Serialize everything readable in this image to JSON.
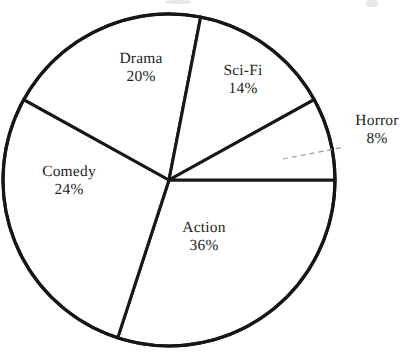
{
  "chart_data": {
    "type": "pie",
    "title": "",
    "xlabel": "",
    "ylabel": "",
    "categories": [
      "Action",
      "Comedy",
      "Drama",
      "Sci-Fi",
      "Horror"
    ],
    "values": [
      36,
      24,
      20,
      14,
      8
    ],
    "value_suffix": "%",
    "legend_position": "none",
    "grid": false,
    "slices": [
      {
        "name": "Action",
        "value": 36,
        "value_label": "36%",
        "start_angle_deg": 252,
        "end_angle_deg": 360,
        "label_x": 204,
        "label_y": 237,
        "label_placement": "inside",
        "fill": "#ffffff",
        "stroke": "#181818"
      },
      {
        "name": "Comedy",
        "value": 24,
        "value_label": "24%",
        "start_angle_deg": 151,
        "end_angle_deg": 252,
        "label_x": 69,
        "label_y": 181,
        "label_placement": "inside",
        "fill": "#ffffff",
        "stroke": "#181818"
      },
      {
        "name": "Drama",
        "value": 20,
        "value_label": "20%",
        "start_angle_deg": 79,
        "end_angle_deg": 151,
        "label_x": 141,
        "label_y": 68,
        "label_placement": "inside",
        "fill": "#ffffff",
        "stroke": "#181818"
      },
      {
        "name": "Sci-Fi",
        "value": 14,
        "value_label": "14%",
        "start_angle_deg": 29,
        "end_angle_deg": 79,
        "label_x": 243,
        "label_y": 80,
        "label_placement": "inside",
        "fill": "#ffffff",
        "stroke": "#181818"
      },
      {
        "name": "Horror",
        "value": 8,
        "value_label": "8%",
        "start_angle_deg": 0,
        "end_angle_deg": 29,
        "label_x": 377,
        "label_y": 130,
        "label_placement": "outside",
        "fill": "#ffffff",
        "stroke": "#181818"
      }
    ],
    "geometry": {
      "center_x": 169,
      "center_y": 180,
      "radius": 166
    },
    "leader": {
      "x1": 283,
      "y1": 159,
      "x2": 344,
      "y2": 147,
      "color": "#9a9a9a"
    }
  },
  "colors": {
    "background": "#ffffff",
    "outline": "#161616",
    "text": "#221f1e",
    "leader": "#9a9a9a"
  }
}
